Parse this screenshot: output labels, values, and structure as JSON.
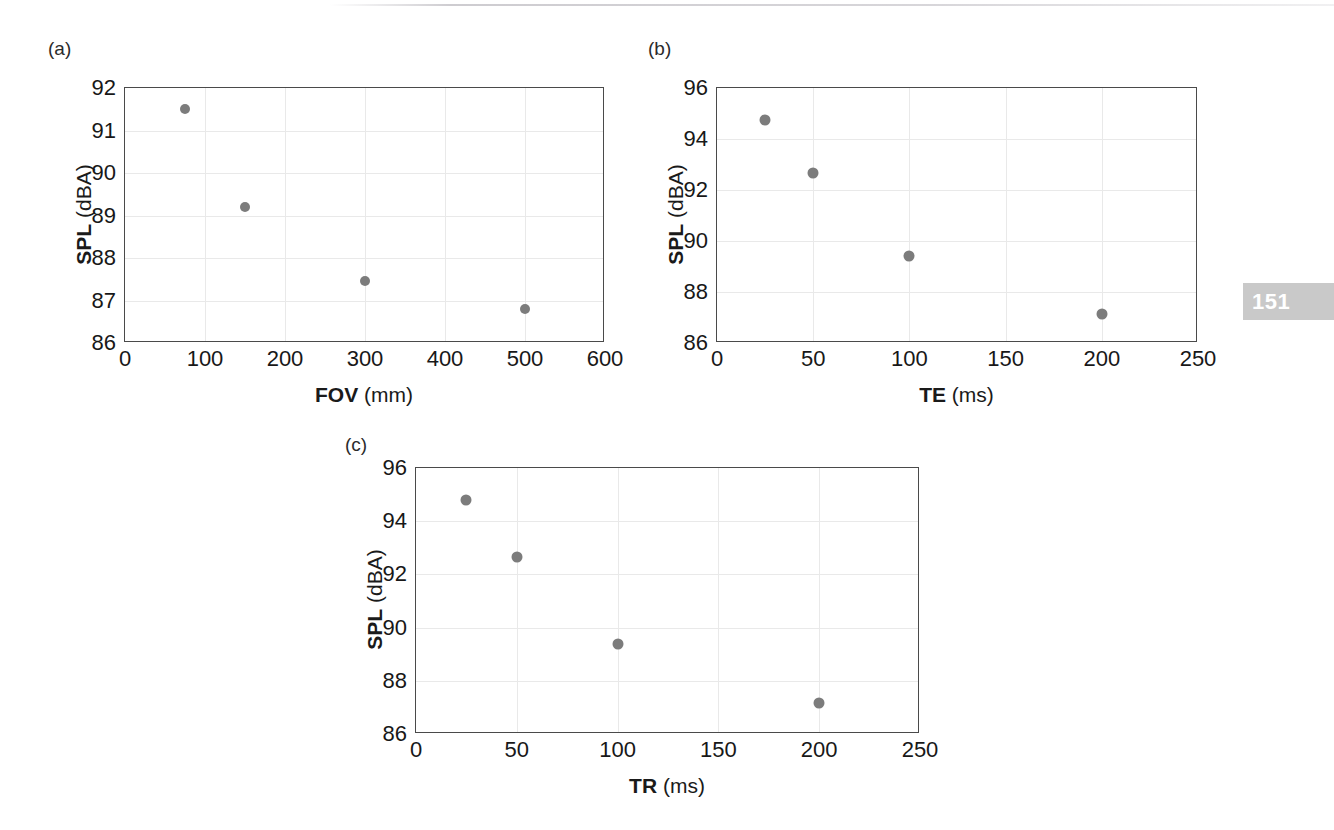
{
  "page": {
    "number_badge": "151"
  },
  "figure": {
    "panels": [
      {
        "tag": "(a)",
        "xlabel_bold": "FOV",
        "xlabel_unit": "(mm)",
        "ylabel_bold": "SPL",
        "ylabel_unit": "(dBA)",
        "xticks": [
          "0",
          "100",
          "200",
          "300",
          "400",
          "500",
          "600"
        ],
        "yticks": [
          "86",
          "87",
          "88",
          "89",
          "90",
          "91",
          "92"
        ]
      },
      {
        "tag": "(b)",
        "xlabel_bold": "TE",
        "xlabel_unit": "(ms)",
        "ylabel_bold": "SPL",
        "ylabel_unit": "(dBA)",
        "xticks": [
          "0",
          "50",
          "100",
          "150",
          "200",
          "250"
        ],
        "yticks": [
          "86",
          "88",
          "90",
          "92",
          "94",
          "96"
        ]
      },
      {
        "tag": "(c)",
        "xlabel_bold": "TR",
        "xlabel_unit": "(ms)",
        "ylabel_bold": "SPL",
        "ylabel_unit": "(dBA)",
        "xticks": [
          "0",
          "50",
          "100",
          "150",
          "200",
          "250"
        ],
        "yticks": [
          "86",
          "88",
          "90",
          "92",
          "94",
          "96"
        ]
      }
    ]
  },
  "chart_data": [
    {
      "type": "scatter",
      "panel": "(a)",
      "title": "",
      "xlabel": "FOV (mm)",
      "ylabel": "SPL (dBA)",
      "xlim": [
        0,
        600
      ],
      "ylim": [
        86,
        92
      ],
      "xticks": [
        0,
        100,
        200,
        300,
        400,
        500,
        600
      ],
      "yticks": [
        86,
        87,
        88,
        89,
        90,
        91,
        92
      ],
      "grid": true,
      "legend": null,
      "marker_color": "#7c7c7c",
      "x": [
        75,
        150,
        300,
        500
      ],
      "y": [
        91.5,
        89.2,
        87.45,
        86.8
      ]
    },
    {
      "type": "scatter",
      "panel": "(b)",
      "title": "",
      "xlabel": "TE (ms)",
      "ylabel": "SPL (dBA)",
      "xlim": [
        0,
        250
      ],
      "ylim": [
        86,
        96
      ],
      "xticks": [
        0,
        50,
        100,
        150,
        200,
        250
      ],
      "yticks": [
        86,
        88,
        90,
        92,
        94,
        96
      ],
      "grid": true,
      "legend": null,
      "marker_color": "#7c7c7c",
      "x": [
        25,
        50,
        100,
        200
      ],
      "y": [
        94.75,
        92.65,
        89.4,
        87.15
      ]
    },
    {
      "type": "scatter",
      "panel": "(c)",
      "title": "",
      "xlabel": "TR (ms)",
      "ylabel": "SPL (dBA)",
      "xlim": [
        0,
        250
      ],
      "ylim": [
        86,
        96
      ],
      "xticks": [
        0,
        50,
        100,
        150,
        200,
        250
      ],
      "yticks": [
        86,
        88,
        90,
        92,
        94,
        96
      ],
      "grid": true,
      "legend": null,
      "marker_color": "#7c7c7c",
      "x": [
        25,
        50,
        100,
        200
      ],
      "y": [
        94.8,
        92.65,
        89.4,
        87.15
      ]
    }
  ]
}
